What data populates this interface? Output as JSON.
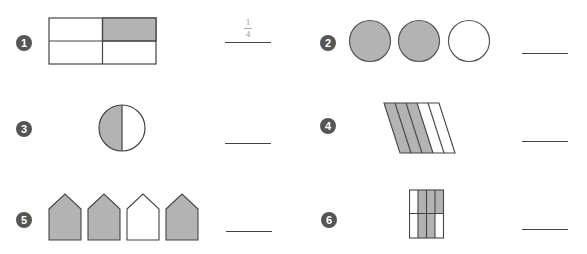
{
  "colors": {
    "shade": "#b3b3b3",
    "stroke": "#444444",
    "badge": "#555555"
  },
  "problems": [
    {
      "number": "1",
      "shape": "rectangle-2x2",
      "parts": 4,
      "shaded": 1,
      "answer_numerator": "1",
      "answer_denominator": "4"
    },
    {
      "number": "2",
      "shape": "three-circles",
      "parts": 3,
      "shaded": 2,
      "answer": ""
    },
    {
      "number": "3",
      "shape": "circle-halves",
      "parts": 2,
      "shaded": 1,
      "answer": ""
    },
    {
      "number": "4",
      "shape": "parallelogram-5-strips",
      "parts": 5,
      "shaded": 3,
      "answer": ""
    },
    {
      "number": "5",
      "shape": "four-pentagons",
      "parts": 4,
      "shaded": 3,
      "answer": ""
    },
    {
      "number": "6",
      "shape": "rectangle-4x2",
      "parts": 8,
      "shaded": 5,
      "answer": ""
    }
  ]
}
